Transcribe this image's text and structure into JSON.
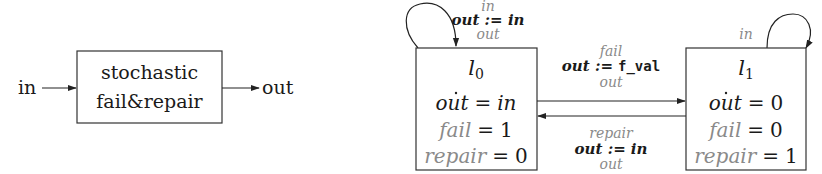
{
  "block_diagram": {
    "input_label": "in",
    "output_label": "out",
    "block_lines": [
      "stochastic",
      "fail&repair"
    ]
  },
  "automaton": {
    "locations": [
      {
        "id": "l0",
        "name": "l",
        "subscript": "0",
        "assignments": [
          {
            "var": "out",
            "op": "=",
            "value": "in",
            "style": "black",
            "dotted": true
          },
          {
            "var": "fail",
            "op": "=",
            "value": "1",
            "style": "gray"
          },
          {
            "var": "repair",
            "op": "=",
            "value": "0",
            "style": "gray"
          }
        ],
        "self_loop": {
          "input": "in",
          "update": "out := in",
          "output": "out"
        }
      },
      {
        "id": "l1",
        "name": "l",
        "subscript": "1",
        "assignments": [
          {
            "var": "out",
            "op": "=",
            "value": "0",
            "style": "black",
            "dotted": true
          },
          {
            "var": "fail",
            "op": "=",
            "value": "0",
            "style": "gray"
          },
          {
            "var": "repair",
            "op": "=",
            "value": "1",
            "style": "gray"
          }
        ],
        "self_loop": {
          "input": "in"
        }
      }
    ],
    "transitions": [
      {
        "from": "l0",
        "to": "l1",
        "input": "fail",
        "update_var": "out :=",
        "update_value": "f_val",
        "output": "out"
      },
      {
        "from": "l1",
        "to": "l0",
        "input": "repair",
        "update_var": "out :=",
        "update_value": "in",
        "output": "out"
      }
    ]
  },
  "colors": {
    "stroke": "#222222",
    "text": "#1a1a1a",
    "secondary_text": "#8a8a8a"
  }
}
